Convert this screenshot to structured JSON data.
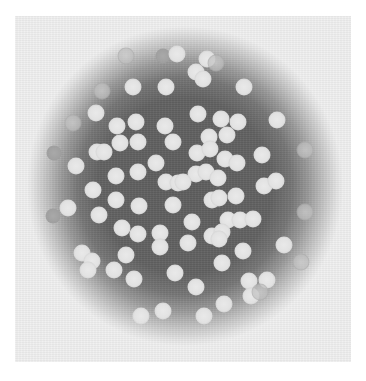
{
  "figure": {
    "colors": {
      "page_background": "#ffffff",
      "panel_background": "#f1f1f1",
      "dark_center": "#5e5e5e",
      "sphere": "#e2e2e2",
      "faded_sphere": "#bebebe",
      "grey_sphere": "#a0a0a0"
    },
    "panel": {
      "x": 15,
      "y": 16,
      "width": 336,
      "height": 346
    },
    "spheres": [
      {
        "x": 126,
        "y": 56,
        "type": "faded"
      },
      {
        "x": 163,
        "y": 56,
        "type": "grey"
      },
      {
        "x": 177,
        "y": 54,
        "type": "normal"
      },
      {
        "x": 207,
        "y": 59,
        "type": "normal"
      },
      {
        "x": 216,
        "y": 63,
        "type": "faded"
      },
      {
        "x": 196,
        "y": 72,
        "type": "normal"
      },
      {
        "x": 203,
        "y": 79,
        "type": "normal"
      },
      {
        "x": 133,
        "y": 87,
        "type": "normal"
      },
      {
        "x": 166,
        "y": 87,
        "type": "normal"
      },
      {
        "x": 244,
        "y": 87,
        "type": "normal"
      },
      {
        "x": 102,
        "y": 91,
        "type": "faded"
      },
      {
        "x": 96,
        "y": 113,
        "type": "normal"
      },
      {
        "x": 198,
        "y": 114,
        "type": "normal"
      },
      {
        "x": 73,
        "y": 123,
        "type": "faded"
      },
      {
        "x": 117,
        "y": 126,
        "type": "normal"
      },
      {
        "x": 136,
        "y": 122,
        "type": "normal"
      },
      {
        "x": 165,
        "y": 126,
        "type": "normal"
      },
      {
        "x": 221,
        "y": 119,
        "type": "normal"
      },
      {
        "x": 238,
        "y": 122,
        "type": "normal"
      },
      {
        "x": 227,
        "y": 135,
        "type": "normal"
      },
      {
        "x": 277,
        "y": 120,
        "type": "normal"
      },
      {
        "x": 209,
        "y": 137,
        "type": "normal"
      },
      {
        "x": 120,
        "y": 143,
        "type": "normal"
      },
      {
        "x": 138,
        "y": 142,
        "type": "normal"
      },
      {
        "x": 173,
        "y": 142,
        "type": "normal"
      },
      {
        "x": 305,
        "y": 150,
        "type": "faded"
      },
      {
        "x": 54,
        "y": 153,
        "type": "grey"
      },
      {
        "x": 97,
        "y": 152,
        "type": "normal"
      },
      {
        "x": 104,
        "y": 152,
        "type": "normal"
      },
      {
        "x": 156,
        "y": 163,
        "type": "normal"
      },
      {
        "x": 197,
        "y": 153,
        "type": "normal"
      },
      {
        "x": 210,
        "y": 149,
        "type": "normal"
      },
      {
        "x": 225,
        "y": 159,
        "type": "normal"
      },
      {
        "x": 237,
        "y": 163,
        "type": "normal"
      },
      {
        "x": 262,
        "y": 155,
        "type": "normal"
      },
      {
        "x": 76,
        "y": 166,
        "type": "normal"
      },
      {
        "x": 116,
        "y": 176,
        "type": "normal"
      },
      {
        "x": 138,
        "y": 172,
        "type": "normal"
      },
      {
        "x": 196,
        "y": 174,
        "type": "normal"
      },
      {
        "x": 206,
        "y": 172,
        "type": "normal"
      },
      {
        "x": 218,
        "y": 178,
        "type": "normal"
      },
      {
        "x": 166,
        "y": 182,
        "type": "normal"
      },
      {
        "x": 178,
        "y": 183,
        "type": "normal"
      },
      {
        "x": 183,
        "y": 182,
        "type": "normal"
      },
      {
        "x": 264,
        "y": 186,
        "type": "normal"
      },
      {
        "x": 276,
        "y": 181,
        "type": "normal"
      },
      {
        "x": 93,
        "y": 190,
        "type": "normal"
      },
      {
        "x": 236,
        "y": 196,
        "type": "normal"
      },
      {
        "x": 116,
        "y": 200,
        "type": "normal"
      },
      {
        "x": 212,
        "y": 200,
        "type": "normal"
      },
      {
        "x": 219,
        "y": 198,
        "type": "normal"
      },
      {
        "x": 139,
        "y": 206,
        "type": "normal"
      },
      {
        "x": 173,
        "y": 205,
        "type": "normal"
      },
      {
        "x": 68,
        "y": 208,
        "type": "normal"
      },
      {
        "x": 305,
        "y": 212,
        "type": "faded"
      },
      {
        "x": 53,
        "y": 216,
        "type": "grey"
      },
      {
        "x": 99,
        "y": 215,
        "type": "normal"
      },
      {
        "x": 192,
        "y": 222,
        "type": "normal"
      },
      {
        "x": 228,
        "y": 220,
        "type": "normal"
      },
      {
        "x": 240,
        "y": 220,
        "type": "normal"
      },
      {
        "x": 253,
        "y": 219,
        "type": "normal"
      },
      {
        "x": 122,
        "y": 228,
        "type": "normal"
      },
      {
        "x": 138,
        "y": 234,
        "type": "normal"
      },
      {
        "x": 160,
        "y": 233,
        "type": "normal"
      },
      {
        "x": 212,
        "y": 236,
        "type": "normal"
      },
      {
        "x": 222,
        "y": 232,
        "type": "normal"
      },
      {
        "x": 160,
        "y": 247,
        "type": "normal"
      },
      {
        "x": 188,
        "y": 243,
        "type": "normal"
      },
      {
        "x": 219,
        "y": 239,
        "type": "normal"
      },
      {
        "x": 243,
        "y": 251,
        "type": "normal"
      },
      {
        "x": 284,
        "y": 245,
        "type": "normal"
      },
      {
        "x": 82,
        "y": 253,
        "type": "normal"
      },
      {
        "x": 92,
        "y": 261,
        "type": "normal"
      },
      {
        "x": 126,
        "y": 255,
        "type": "normal"
      },
      {
        "x": 222,
        "y": 263,
        "type": "normal"
      },
      {
        "x": 301,
        "y": 262,
        "type": "faded"
      },
      {
        "x": 88,
        "y": 270,
        "type": "normal"
      },
      {
        "x": 114,
        "y": 270,
        "type": "normal"
      },
      {
        "x": 134,
        "y": 279,
        "type": "normal"
      },
      {
        "x": 175,
        "y": 273,
        "type": "normal"
      },
      {
        "x": 249,
        "y": 281,
        "type": "normal"
      },
      {
        "x": 267,
        "y": 280,
        "type": "normal"
      },
      {
        "x": 196,
        "y": 287,
        "type": "normal"
      },
      {
        "x": 251,
        "y": 296,
        "type": "normal"
      },
      {
        "x": 260,
        "y": 292,
        "type": "faded"
      },
      {
        "x": 224,
        "y": 304,
        "type": "normal"
      },
      {
        "x": 163,
        "y": 311,
        "type": "normal"
      },
      {
        "x": 141,
        "y": 316,
        "type": "normal"
      },
      {
        "x": 204,
        "y": 316,
        "type": "normal"
      }
    ]
  }
}
